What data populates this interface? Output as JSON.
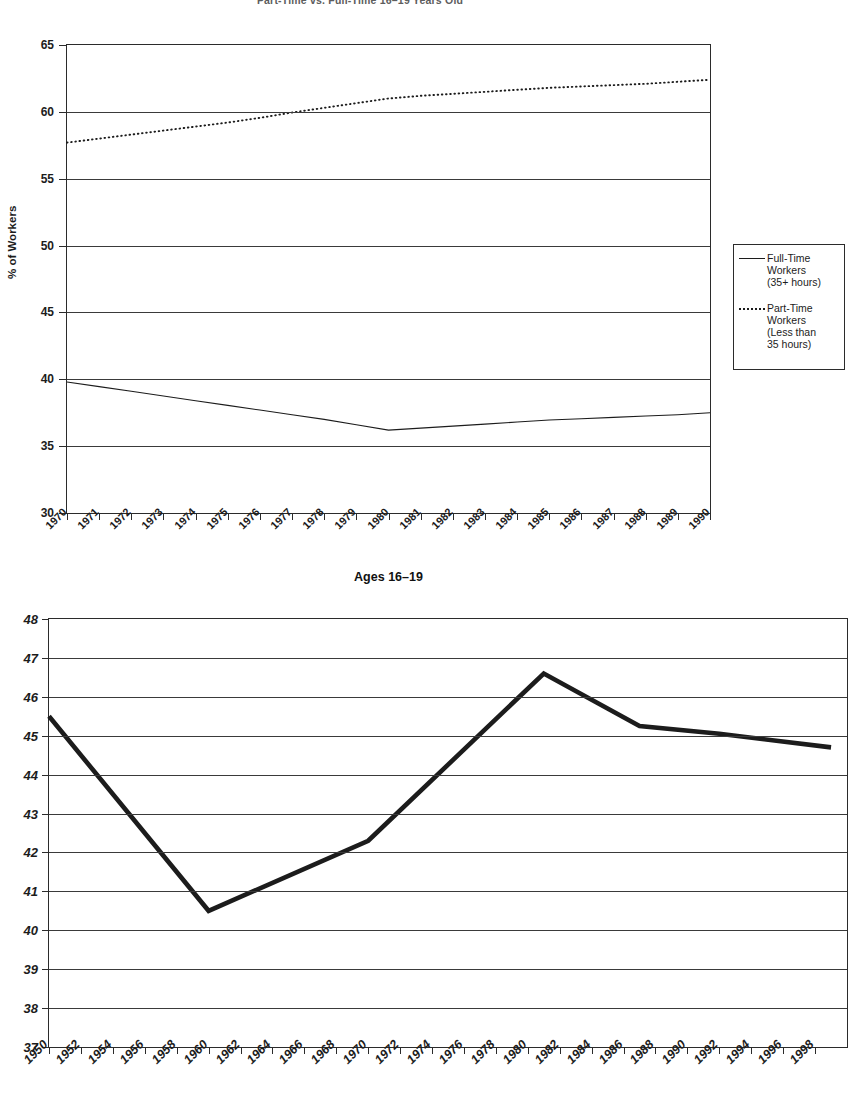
{
  "chart_data": [
    {
      "id": "top",
      "type": "line",
      "title": "Part-Time vs. Full-Time 16–19 Years Old",
      "xlabel": "Ages 16–19",
      "ylabel": "% of Workers",
      "ylim": [
        30,
        65
      ],
      "ytick_step": 5,
      "yticks": [
        65,
        60,
        55,
        50,
        45,
        40,
        35,
        30
      ],
      "xlim": [
        1970,
        1990
      ],
      "x": [
        1970,
        1971,
        1972,
        1973,
        1974,
        1975,
        1976,
        1977,
        1978,
        1979,
        1980,
        1981,
        1982,
        1983,
        1984,
        1985,
        1986,
        1987,
        1988,
        1989,
        1990
      ],
      "xticks": [
        "1970",
        "1971",
        "1972",
        "1973",
        "1974",
        "1975",
        "1976",
        "1977",
        "1978",
        "1979",
        "1980",
        "1981",
        "1982",
        "1983",
        "1984",
        "1985",
        "1986",
        "1987",
        "1988",
        "1989",
        "1990"
      ],
      "grid": true,
      "legend_position": "right-outside",
      "series": [
        {
          "name": "Full-Time Workers (35+ hours)",
          "style": "solid",
          "color": "#1c1c1c",
          "values": [
            39.8,
            39.45,
            39.1,
            38.75,
            38.4,
            38.05,
            37.7,
            37.35,
            37.0,
            36.6,
            36.2,
            36.35,
            36.5,
            36.65,
            36.8,
            36.95,
            37.05,
            37.15,
            37.25,
            37.35,
            37.5
          ]
        },
        {
          "name": "Part-Time Workers (Less than 35 hours)",
          "style": "dotted",
          "color": "#1c1c1c",
          "values": [
            57.7,
            58.0,
            58.3,
            58.6,
            58.9,
            59.2,
            59.55,
            59.95,
            60.3,
            60.65,
            61.0,
            61.2,
            61.35,
            61.5,
            61.65,
            61.8,
            61.9,
            62.0,
            62.1,
            62.25,
            62.4
          ]
        }
      ],
      "legend": [
        {
          "label_lines": [
            "Full-Time",
            "Workers",
            "(35+ hours)"
          ],
          "style": "solid"
        },
        {
          "label_lines": [
            "Part-Time",
            "Workers",
            "(Less than",
            "35 hours)"
          ],
          "style": "dotted"
        }
      ]
    },
    {
      "id": "bottom",
      "type": "line",
      "title": "",
      "xlabel": "",
      "ylabel": "",
      "ylim": [
        37,
        48
      ],
      "ytick_step": 1,
      "yticks": [
        48,
        47,
        46,
        45,
        44,
        43,
        42,
        41,
        40,
        39,
        38,
        37
      ],
      "xlim": [
        1950,
        2000
      ],
      "xticks": [
        "1950",
        "1952",
        "1954",
        "1956",
        "1958",
        "1960",
        "1962",
        "1964",
        "1966",
        "1968",
        "1970",
        "1972",
        "1974",
        "1976",
        "1978",
        "1980",
        "1982",
        "1984",
        "1986",
        "1988",
        "1990",
        "1992",
        "1994",
        "1996",
        "1998"
      ],
      "grid": true,
      "series": [
        {
          "name": "",
          "style": "solid-thick",
          "color": "#1c1c1c",
          "x": [
            1950,
            1960,
            1970,
            1981,
            1987,
            1992,
            1999
          ],
          "values": [
            45.5,
            40.5,
            42.3,
            46.6,
            45.25,
            45.05,
            44.7
          ]
        }
      ]
    }
  ]
}
